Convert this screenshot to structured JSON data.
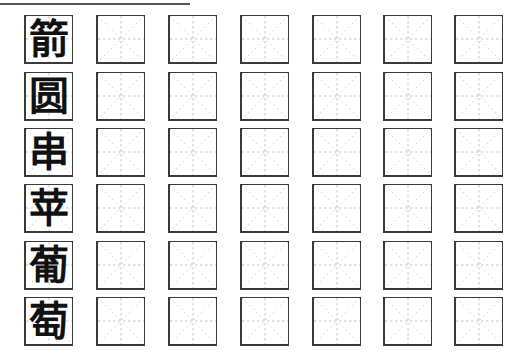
{
  "worksheet": {
    "title_rule": true,
    "grid_type": "mi-zi-ge",
    "columns": 7,
    "rows": [
      {
        "char": "箭"
      },
      {
        "char": "圆"
      },
      {
        "char": "串"
      },
      {
        "char": "苹"
      },
      {
        "char": "葡"
      },
      {
        "char": "萄"
      }
    ],
    "colors": {
      "border": "#3a3a3a",
      "guide": "#b8b8b8",
      "char": "#111111"
    }
  }
}
